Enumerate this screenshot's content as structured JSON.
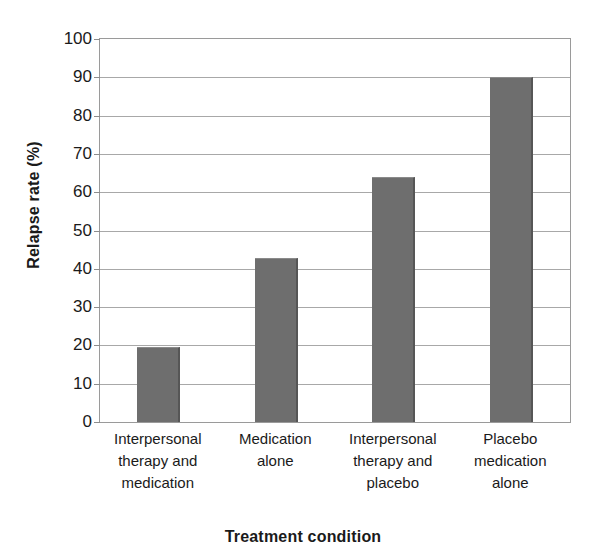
{
  "chart_data": {
    "type": "bar",
    "title": "",
    "subtitle": "",
    "xlabel": "Treatment condition",
    "ylabel": "Relapse rate (%)",
    "categories": [
      "Interpersonal therapy and medication",
      "Medication alone",
      "Interpersonal therapy and placebo",
      "Placebo medication alone"
    ],
    "category_lines": [
      [
        "Interpersonal",
        "therapy and",
        "medication"
      ],
      [
        "Medication",
        "alone"
      ],
      [
        "Interpersonal",
        "therapy and",
        "placebo"
      ],
      [
        "Placebo",
        "medication",
        "alone"
      ]
    ],
    "values": [
      19.5,
      42.7,
      64,
      90
    ],
    "ylim": [
      0,
      100
    ],
    "ytick_step": 10,
    "yticks": [
      100,
      90,
      80,
      70,
      60,
      50,
      40,
      30,
      20,
      10,
      0
    ],
    "grid": true,
    "legend": "none",
    "bar_color": "#6e6e6e",
    "bar_edge_color": "#565656",
    "gridline_color": "#a8a8a8",
    "axis_color": "#9a9a9a",
    "background_color": "#ffffff"
  }
}
